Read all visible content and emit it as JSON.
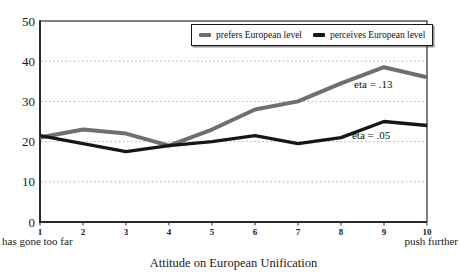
{
  "chart_data": {
    "type": "line",
    "title": "",
    "xlabel": "Attitude on European Unification",
    "ylabel": "",
    "x": [
      1,
      2,
      3,
      4,
      5,
      6,
      7,
      8,
      9,
      10
    ],
    "x_tick_labels": [
      "1",
      "2",
      "3",
      "4",
      "5",
      "6",
      "7",
      "8",
      "9",
      "10"
    ],
    "y_ticks": [
      0,
      10,
      20,
      30,
      40,
      50
    ],
    "y_tick_labels": [
      "0",
      "10",
      "20",
      "30",
      "40",
      "50"
    ],
    "xlim": [
      1,
      10
    ],
    "ylim": [
      0,
      50
    ],
    "grid": "horizontal dotted lines at 10, 20, 30, 40",
    "legend_position": "top-right inside plot",
    "x_min_label": "has gone too far",
    "x_max_label": "push further",
    "series": [
      {
        "name": "prefers European level",
        "color": "#6f6f6f",
        "values": [
          21,
          23,
          22,
          19,
          23,
          28,
          30,
          34.5,
          38.5,
          36
        ]
      },
      {
        "name": "perceives European level",
        "color": "#161616",
        "values": [
          21.5,
          19.5,
          17.5,
          19,
          20,
          21.5,
          19.5,
          21,
          25,
          24
        ]
      }
    ],
    "annotations": [
      {
        "text": "eta = .13",
        "x": 8.75,
        "y": 34
      },
      {
        "text": "eta = .05",
        "x": 8.7,
        "y": 21.5
      }
    ]
  },
  "colors": {
    "frame": "#2a2a2a",
    "gridline": "#b0b0b0",
    "background": "#ffffff",
    "text": "#1a1a1a"
  }
}
